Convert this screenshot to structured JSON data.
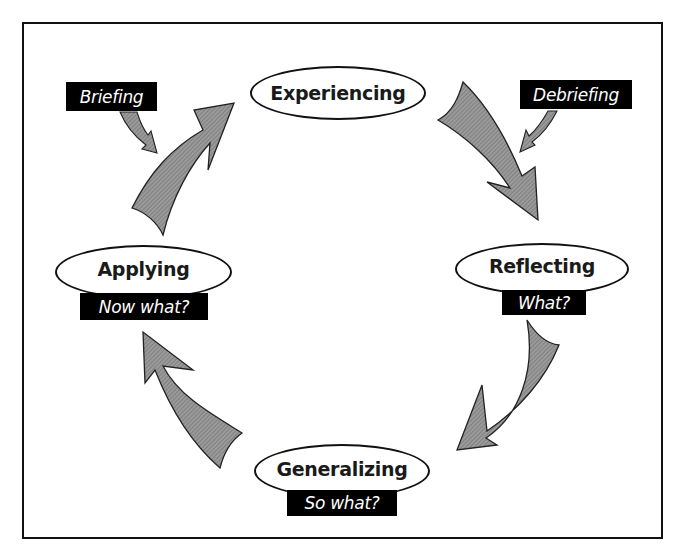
{
  "diagram": {
    "type": "cycle",
    "colors": {
      "arrow_fill": "#8a8a8a",
      "arrow_stroke": "#222222",
      "tag_bg": "#000000",
      "tag_text": "#ffffff",
      "frame": "#111111"
    },
    "stages": [
      {
        "id": "experiencing",
        "label": "Experiencing",
        "question": ""
      },
      {
        "id": "reflecting",
        "label": "Reflecting",
        "question": "What?"
      },
      {
        "id": "generalizing",
        "label": "Generalizing",
        "question": "So what?"
      },
      {
        "id": "applying",
        "label": "Applying",
        "question": "Now what?"
      }
    ],
    "side_labels": [
      {
        "id": "briefing",
        "label": "Briefing",
        "points_to": "applying-to-experiencing arrow"
      },
      {
        "id": "debriefing",
        "label": "Debriefing",
        "points_to": "experiencing-to-reflecting arrow"
      }
    ],
    "edges": [
      {
        "from": "experiencing",
        "to": "reflecting"
      },
      {
        "from": "reflecting",
        "to": "generalizing"
      },
      {
        "from": "generalizing",
        "to": "applying"
      },
      {
        "from": "applying",
        "to": "experiencing"
      }
    ]
  }
}
